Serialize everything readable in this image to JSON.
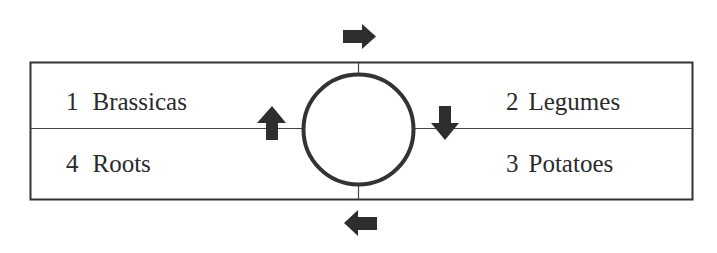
{
  "diagram": {
    "title": "",
    "type": "crop-rotation",
    "quadrants": [
      {
        "position": "top-left",
        "number": "1",
        "name": "Brassicas"
      },
      {
        "position": "top-right",
        "number": "2",
        "name": "Legumes"
      },
      {
        "position": "bottom-right",
        "number": "3",
        "name": "Potatoes"
      },
      {
        "position": "bottom-left",
        "number": "4",
        "name": "Roots"
      }
    ],
    "arrows": [
      {
        "location": "top",
        "direction": "right",
        "icon": "arrow-right-icon"
      },
      {
        "location": "right",
        "direction": "down",
        "icon": "arrow-down-icon"
      },
      {
        "location": "bottom",
        "direction": "left",
        "icon": "arrow-left-icon"
      },
      {
        "location": "left",
        "direction": "up",
        "icon": "arrow-up-icon"
      }
    ],
    "colors": {
      "stroke": "#333333",
      "arrow_fill": "#2e2e2e",
      "background": "#ffffff",
      "text": "#2a2a2a"
    }
  }
}
